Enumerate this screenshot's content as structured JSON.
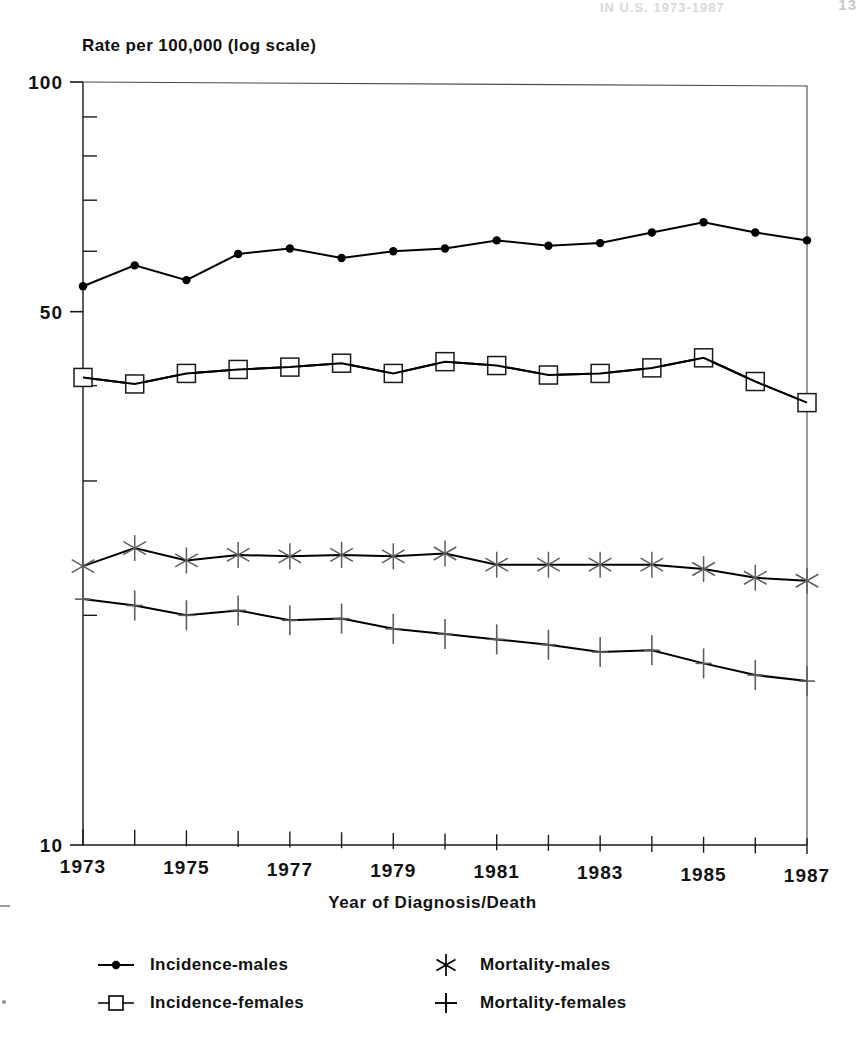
{
  "page": {
    "header_text": "IN U.S. 1973-1987",
    "folio": "13"
  },
  "axes": {
    "y_title": "Rate per 100,000 (log scale)",
    "x_title": "Year of Diagnosis/Death",
    "y_labels": [
      "100",
      "50",
      "10"
    ],
    "x_labels": [
      "1973",
      "1975",
      "1977",
      "1979",
      "1981",
      "1983",
      "1985",
      "1987"
    ]
  },
  "legend": {
    "items": [
      {
        "label": "Incidence-males",
        "marker": "filled-circle-icon"
      },
      {
        "label": "Mortality-males",
        "marker": "asterisk-icon"
      },
      {
        "label": "Incidence-females",
        "marker": "open-square-icon"
      },
      {
        "label": "Mortality-females",
        "marker": "plus-icon"
      }
    ]
  },
  "chart_data": {
    "type": "line",
    "title": "",
    "xlabel": "Year of Diagnosis/Death",
    "ylabel": "Rate per 100,000 (log scale)",
    "yscale": "log",
    "ylim": [
      10,
      100
    ],
    "yticks_labeled": [
      10,
      50,
      100
    ],
    "yticks_minor": [
      20,
      30,
      40,
      60,
      70,
      80,
      90
    ],
    "grid": false,
    "legend_position": "below",
    "x": [
      1973,
      1974,
      1975,
      1976,
      1977,
      1978,
      1979,
      1980,
      1981,
      1982,
      1983,
      1984,
      1985,
      1986,
      1987
    ],
    "series": [
      {
        "name": "Incidence-males",
        "marker": "filled-circle",
        "values": [
          54.0,
          57.5,
          55.0,
          59.5,
          60.5,
          58.8,
          60.0,
          60.5,
          62.0,
          61.0,
          61.5,
          63.5,
          65.5,
          63.5,
          62.0
        ]
      },
      {
        "name": "Incidence-females",
        "marker": "open-square",
        "values": [
          41.0,
          40.2,
          41.5,
          42.0,
          42.3,
          42.8,
          41.5,
          43.0,
          42.5,
          41.3,
          41.5,
          42.2,
          43.5,
          40.5,
          38.0
        ]
      },
      {
        "name": "Mortality-males",
        "marker": "asterisk",
        "values": [
          23.2,
          24.5,
          23.6,
          24.0,
          23.9,
          24.0,
          23.9,
          24.1,
          23.3,
          23.3,
          23.3,
          23.3,
          23.0,
          22.4,
          22.2
        ]
      },
      {
        "name": "Mortality-females",
        "marker": "plus",
        "values": [
          21.0,
          20.6,
          20.0,
          20.3,
          19.7,
          19.8,
          19.2,
          18.9,
          18.6,
          18.3,
          17.9,
          18.0,
          17.3,
          16.7,
          16.4
        ]
      }
    ]
  }
}
